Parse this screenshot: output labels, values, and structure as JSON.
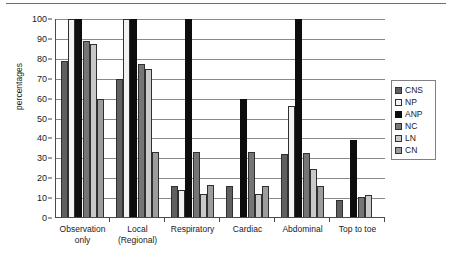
{
  "chart_data": {
    "type": "bar",
    "title": "",
    "xlabel": "",
    "ylabel": "percentages",
    "ylim": [
      0,
      100
    ],
    "ytick_step": 10,
    "yticks": [
      0,
      10,
      20,
      30,
      40,
      50,
      60,
      70,
      80,
      90,
      100
    ],
    "grid": true,
    "legend_position": "right",
    "categories": [
      "Observation only",
      "Local (Regional)",
      "Respiratory",
      "Cardiac",
      "Abdominal",
      "Top to toe"
    ],
    "category_lines": [
      [
        "Observation",
        "only"
      ],
      [
        "Local",
        "(Regional)"
      ],
      [
        "Respiratory"
      ],
      [
        "Cardiac"
      ],
      [
        "Abdominal"
      ],
      [
        "Top to toe"
      ]
    ],
    "series": [
      {
        "name": "CNS",
        "color": "#606060",
        "values": [
          79,
          70,
          16,
          16,
          32,
          9
        ]
      },
      {
        "name": "NP",
        "color": "#f2f2f2",
        "values": [
          100,
          100,
          14,
          0,
          56.5,
          0
        ]
      },
      {
        "name": "ANP",
        "color": "#0d0d0d",
        "values": [
          100,
          100,
          100,
          60,
          100,
          39
        ]
      },
      {
        "name": "NC",
        "color": "#757575",
        "values": [
          89,
          77.5,
          33,
          33,
          32.5,
          10.5
        ]
      },
      {
        "name": "LN",
        "color": "#c9c9c9",
        "values": [
          87.5,
          75,
          12,
          12,
          24.5,
          11.5
        ]
      },
      {
        "name": "CN",
        "color": "#9d9d9d",
        "values": [
          60,
          33,
          16.5,
          16,
          16,
          0
        ]
      }
    ]
  },
  "legend": {
    "items": [
      {
        "label": "CNS"
      },
      {
        "label": "NP"
      },
      {
        "label": "ANP"
      },
      {
        "label": "NC"
      },
      {
        "label": "LN"
      },
      {
        "label": "CN"
      }
    ]
  },
  "axis": {
    "y_title": "percentages"
  }
}
